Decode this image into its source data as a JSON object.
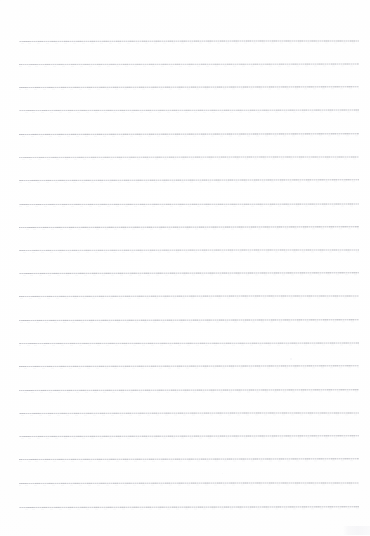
{
  "document": {
    "kind": "lined-paper-scan",
    "title": "",
    "page_text": "",
    "background_color": "#ffffff",
    "rule_color": "#c6c8ce",
    "rule_ink_color": "#b9bbc2",
    "width_px": 370,
    "height_px": 536
  },
  "layout": {
    "left_margin_px": 19,
    "right_edge_px": 359,
    "first_rule_y_px": 41,
    "rule_spacing_px": 23.3,
    "rule_count": 21,
    "top_blank_px": 41,
    "bottom_blank_px": 29
  },
  "rules": [
    {
      "y": 41,
      "x1": 19,
      "x2": 359,
      "opacity": 0.86,
      "tilt": -0.1
    },
    {
      "y": 64,
      "x1": 19,
      "x2": 359,
      "opacity": 0.8,
      "tilt": -0.08
    },
    {
      "y": 87,
      "x1": 19,
      "x2": 359,
      "opacity": 0.88,
      "tilt": -0.12
    },
    {
      "y": 110,
      "x1": 19,
      "x2": 359,
      "opacity": 0.84,
      "tilt": -0.09
    },
    {
      "y": 134,
      "x1": 19,
      "x2": 359,
      "opacity": 0.9,
      "tilt": -0.11
    },
    {
      "y": 157,
      "x1": 19,
      "x2": 359,
      "opacity": 0.82,
      "tilt": -0.1
    },
    {
      "y": 180,
      "x1": 19,
      "x2": 359,
      "opacity": 0.87,
      "tilt": -0.12
    },
    {
      "y": 204,
      "x1": 19,
      "x2": 359,
      "opacity": 0.85,
      "tilt": -0.09
    },
    {
      "y": 227,
      "x1": 19,
      "x2": 359,
      "opacity": 0.92,
      "tilt": -0.13
    },
    {
      "y": 250,
      "x1": 19,
      "x2": 359,
      "opacity": 0.83,
      "tilt": -0.1
    },
    {
      "y": 273,
      "x1": 19,
      "x2": 359,
      "opacity": 0.89,
      "tilt": -0.11
    },
    {
      "y": 296,
      "x1": 19,
      "x2": 359,
      "opacity": 0.86,
      "tilt": -0.1
    },
    {
      "y": 320,
      "x1": 19,
      "x2": 359,
      "opacity": 0.91,
      "tilt": -0.12
    },
    {
      "y": 343,
      "x1": 19,
      "x2": 359,
      "opacity": 0.84,
      "tilt": -0.09
    },
    {
      "y": 366,
      "x1": 19,
      "x2": 359,
      "opacity": 0.88,
      "tilt": -0.11
    },
    {
      "y": 390,
      "x1": 19,
      "x2": 359,
      "opacity": 0.9,
      "tilt": -0.12
    },
    {
      "y": 413,
      "x1": 19,
      "x2": 359,
      "opacity": 0.85,
      "tilt": -0.1
    },
    {
      "y": 436,
      "x1": 19,
      "x2": 359,
      "opacity": 0.87,
      "tilt": -0.11
    },
    {
      "y": 459,
      "x1": 19,
      "x2": 359,
      "opacity": 0.89,
      "tilt": -0.12
    },
    {
      "y": 483,
      "x1": 19,
      "x2": 359,
      "opacity": 0.86,
      "tilt": -0.1
    },
    {
      "y": 507,
      "x1": 19,
      "x2": 359,
      "opacity": 0.88,
      "tilt": -0.13
    }
  ],
  "specks": [
    {
      "x": 290,
      "y": 358,
      "size": 2,
      "opacity": 0.55
    },
    {
      "x": 152,
      "y": 437,
      "size": 1,
      "opacity": 0.4
    },
    {
      "x": 222,
      "y": 473,
      "size": 1,
      "opacity": 0.35
    }
  ],
  "watermark": {
    "label": "",
    "x": 343,
    "y": 526,
    "width": 27,
    "height": 9,
    "opacity": 0.75,
    "color": "#f3f3f6"
  }
}
